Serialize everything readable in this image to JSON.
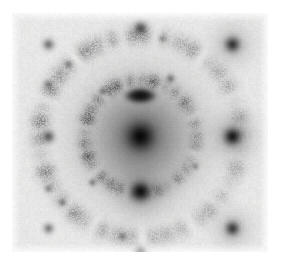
{
  "figure": {
    "kind": "diffraction-pattern",
    "background_color": "#ffffff",
    "panel_color": "#e9e9e7",
    "panel": {
      "x": 12,
      "y": 13,
      "width": 256,
      "height": 239
    },
    "contrast": "inverted (intensity shown dark on light background)"
  },
  "chart_data": {
    "type": "scatter",
    "subtitle": "",
    "xlabel": "",
    "ylabel": "",
    "grid": false,
    "legend": "none",
    "axis_visible": false,
    "tick_labels": [],
    "colormap": "inverted-grayscale",
    "background_level": 233,
    "canvas": {
      "width": 256,
      "height": 239
    },
    "center": {
      "x": 128,
      "y": 123
    },
    "lattice": {
      "description": "square single-crystal spot lattice",
      "a_spacing_px": 92,
      "b_spacing_px": 92,
      "rotation_deg": 0
    },
    "rings": [
      {
        "name": "inner-ring",
        "radius_px": 56,
        "intensity": 0.34,
        "width_px": 7,
        "texture": "speckled polycrystalline arcs"
      },
      {
        "name": "outer-ring",
        "radius_px": 101,
        "intensity": 0.22,
        "width_px": 9,
        "texture": "speckled polycrystalline arcs"
      }
    ],
    "spots": [
      {
        "name": "central-beam",
        "x": 0,
        "y": 0,
        "radius_px": 14.5,
        "intensity": 1.0,
        "order": "000"
      },
      {
        "name": "spot-0-1",
        "x": 0,
        "y": -41,
        "radius_px": 6.5,
        "intensity": 0.62,
        "order": "0 1",
        "shape": "elongated arc"
      },
      {
        "name": "spot-0-n1",
        "x": 0,
        "y": 55,
        "radius_px": 9.5,
        "intensity": 0.92,
        "order": "0 -1"
      },
      {
        "name": "spot-1-0",
        "x": 92,
        "y": 0,
        "radius_px": 8.5,
        "intensity": 0.88,
        "order": "1 0"
      },
      {
        "name": "spot-n1-0",
        "x": -92,
        "y": 0,
        "radius_px": 6.0,
        "intensity": 0.48,
        "order": "-1 0"
      },
      {
        "name": "spot-1-1",
        "x": 92,
        "y": -92,
        "radius_px": 7.5,
        "intensity": 0.7,
        "order": "1 1"
      },
      {
        "name": "spot-n1-1",
        "x": -92,
        "y": -92,
        "radius_px": 5.5,
        "intensity": 0.4,
        "order": "-1 1"
      },
      {
        "name": "spot-1-n1",
        "x": 92,
        "y": 92,
        "radius_px": 7.0,
        "intensity": 0.66,
        "order": "1 -1"
      },
      {
        "name": "spot-n1-n1",
        "x": -92,
        "y": 92,
        "radius_px": 5.0,
        "intensity": 0.36,
        "order": "-1 -1"
      },
      {
        "name": "spot-0-2",
        "x": 0,
        "y": -108,
        "radius_px": 6.5,
        "intensity": 0.55,
        "order": "0 2"
      },
      {
        "name": "spot-0-n2",
        "x": 0,
        "y": 117,
        "radius_px": 6.0,
        "intensity": 0.52,
        "order": "0 -2"
      },
      {
        "name": "spot-n1-up",
        "x": -92,
        "y": -52,
        "radius_px": 4.5,
        "intensity": 0.3,
        "order": "weak"
      },
      {
        "name": "spot-n1-dn",
        "x": -92,
        "y": 52,
        "radius_px": 4.0,
        "intensity": 0.26,
        "order": "weak"
      },
      {
        "name": "spot-arc-ne",
        "x": 30,
        "y": -58,
        "radius_px": 4.5,
        "intensity": 0.34,
        "order": "ring arc"
      },
      {
        "name": "spot-arc-nw",
        "x": -38,
        "y": -45,
        "radius_px": 4.0,
        "intensity": 0.28,
        "order": "ring arc"
      },
      {
        "name": "spot-arc-sw",
        "x": -48,
        "y": 46,
        "radius_px": 4.0,
        "intensity": 0.3,
        "order": "ring arc"
      },
      {
        "name": "spot-arc-se",
        "x": 55,
        "y": 30,
        "radius_px": 3.5,
        "intensity": 0.24,
        "order": "ring arc"
      },
      {
        "name": "spot-outer-nw",
        "x": -72,
        "y": -72,
        "radius_px": 4.0,
        "intensity": 0.26,
        "order": "ring arc"
      },
      {
        "name": "spot-outer-sw",
        "x": -78,
        "y": 66,
        "radius_px": 4.0,
        "intensity": 0.28,
        "order": "ring arc"
      },
      {
        "name": "spot-outer-s",
        "x": -18,
        "y": 100,
        "radius_px": 4.0,
        "intensity": 0.26,
        "order": "ring arc"
      },
      {
        "name": "spot-outer-n",
        "x": 22,
        "y": -98,
        "radius_px": 3.5,
        "intensity": 0.22,
        "order": "ring arc"
      }
    ],
    "halo": {
      "description": "broad diffuse amorphous halo around the central beam",
      "radius_px": 48,
      "intensity": 0.3
    }
  }
}
